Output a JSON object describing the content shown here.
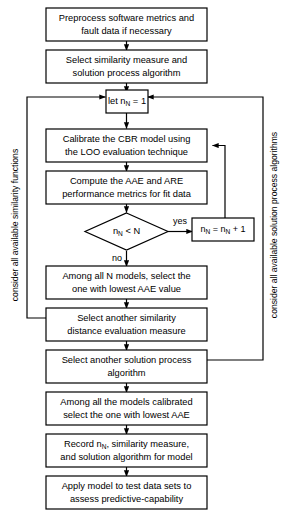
{
  "diagram": {
    "type": "flowchart",
    "background_color": "#ffffff",
    "line_color": "#000000",
    "node_fill": "#ffffff"
  },
  "nodes": {
    "preprocess": {
      "line1": "Preprocess software metrics and",
      "line2": "fault data if necessary"
    },
    "select_similarity": {
      "line1": "Select similarity measure and",
      "line2": "solution process algorithm"
    },
    "init_counter": {
      "prefix": "let n",
      "subscript": "N",
      "suffix": " = 1"
    },
    "calibrate": {
      "line1": "Calibrate the CBR model using",
      "line2": "the LOO evaluation technique"
    },
    "compute_metrics": {
      "line1": "Compute the AAE and ARE",
      "line2": "performance metrics for fit data"
    },
    "decision": {
      "prefix": "n",
      "subscript": "N",
      "suffix": " < N"
    },
    "increment": {
      "prefix": "n",
      "subscript1": "N",
      "middle": " = n",
      "subscript2": "N",
      "suffix": " + 1"
    },
    "select_lowest_aae": {
      "line1": "Among all N models, select the",
      "line2": "one with lowest AAE value"
    },
    "another_similarity": {
      "line1": "Select another similarity",
      "line2": "distance evaluation measure"
    },
    "another_solution": {
      "line1": "Select another solution process",
      "line2": "algorithm"
    },
    "among_calibrated": {
      "line1": "Among all the models calibrated",
      "line2": "select the one with lowest AAE"
    },
    "record": {
      "prefix": "Record n",
      "subscript": "N",
      "suffix": ", similarity measure,",
      "line2": "and solution algorithm for model"
    },
    "apply_model": {
      "line1": "Apply model to test data sets to",
      "line2": "assess predictive-capability"
    }
  },
  "edge_labels": {
    "yes": "yes",
    "no": "no"
  },
  "side_labels": {
    "left": "consider all available similarity functions",
    "right": "consider all available solution process algorithms"
  }
}
